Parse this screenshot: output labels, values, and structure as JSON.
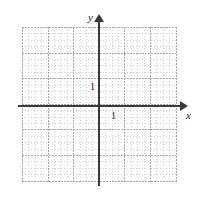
{
  "figure": {
    "name": "cartesian-coordinate-grid"
  },
  "axes": {
    "x_label": "x",
    "y_label": "y",
    "x_unit_tick_label": "1",
    "y_unit_tick_label": "1",
    "axis_color": "#3a3a3a",
    "label_color": "#1a1a1a"
  },
  "grid": {
    "minor_color": "#cfcfcf",
    "major_color": "#a8a8a8",
    "background": "#ffffff",
    "minor_spacing_px": 6.4,
    "major_every_n_minor": 4,
    "left_px": 22,
    "top_px": 27,
    "width_px": 154,
    "height_px": 155
  },
  "chart_data": {
    "type": "scatter",
    "title": "",
    "xlabel": "x",
    "ylabel": "y",
    "x": [],
    "y": [],
    "series": [],
    "xlim": [
      -3,
      3
    ],
    "ylim": [
      -3,
      3
    ],
    "x_tick_labels": [
      "1"
    ],
    "y_tick_labels": [
      "1"
    ],
    "grid": true,
    "legend": "none",
    "annotations": []
  }
}
